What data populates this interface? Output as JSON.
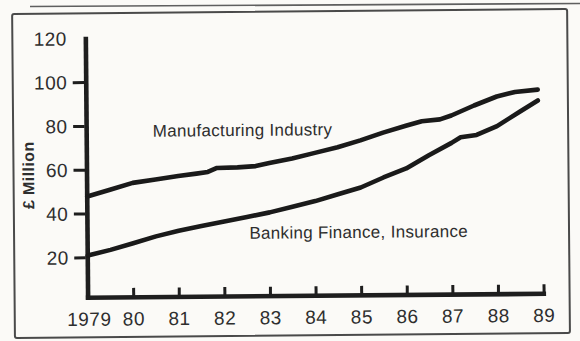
{
  "figure": {
    "background_color": "#fbfaf7",
    "ink_color": "#2e2e2e",
    "curve_color": "#1a1a1a",
    "frame_color": "#4a4a4a"
  },
  "chart_data": {
    "type": "line",
    "title": "",
    "xlabel": "",
    "ylabel": "£ Million",
    "xlim": [
      1979,
      1989
    ],
    "ylim": [
      20,
      120
    ],
    "grid": false,
    "legend_position": "inline-annotations",
    "y_tick_values": [
      120,
      100,
      80,
      60,
      40,
      20
    ],
    "y_tick_labels": [
      "120",
      "100",
      "80",
      "60",
      "40",
      "20"
    ],
    "x_tick_years": [
      1979,
      1980,
      1981,
      1982,
      1983,
      1984,
      1985,
      1986,
      1987,
      1988,
      1989
    ],
    "x_tick_labels": [
      "1979",
      "80",
      "81",
      "82",
      "83",
      "84",
      "85",
      "86",
      "87",
      "88",
      "89"
    ],
    "series": [
      {
        "name": "Manufacturing Industry",
        "color": "#1a1a1a",
        "points": [
          [
            1979,
            48
          ],
          [
            1979.5,
            51
          ],
          [
            1980,
            54
          ],
          [
            1980.5,
            55.5
          ],
          [
            1981,
            57
          ],
          [
            1981.4,
            58
          ],
          [
            1981.65,
            58.7
          ],
          [
            1981.85,
            60.5
          ],
          [
            1982.3,
            60.7
          ],
          [
            1982.7,
            61.2
          ],
          [
            1983,
            62.5
          ],
          [
            1983.5,
            64.5
          ],
          [
            1984,
            67
          ],
          [
            1984.5,
            69.5
          ],
          [
            1985,
            72.5
          ],
          [
            1985.5,
            76
          ],
          [
            1986,
            79
          ],
          [
            1986.35,
            81
          ],
          [
            1986.75,
            81.8
          ],
          [
            1987,
            83.5
          ],
          [
            1987.5,
            88
          ],
          [
            1988,
            92
          ],
          [
            1988.4,
            94
          ],
          [
            1988.9,
            95
          ]
        ]
      },
      {
        "name": "Banking Finance, Insurance",
        "color": "#1a1a1a",
        "points": [
          [
            1979,
            21
          ],
          [
            1979.5,
            23.5
          ],
          [
            1980,
            26.5
          ],
          [
            1980.5,
            29.5
          ],
          [
            1981,
            32
          ],
          [
            1981.5,
            34
          ],
          [
            1982,
            36
          ],
          [
            1982.5,
            38
          ],
          [
            1983,
            40
          ],
          [
            1983.5,
            42.5
          ],
          [
            1984,
            45
          ],
          [
            1984.5,
            48
          ],
          [
            1985,
            51
          ],
          [
            1985.5,
            55.5
          ],
          [
            1986,
            59.5
          ],
          [
            1986.5,
            65.5
          ],
          [
            1987,
            71
          ],
          [
            1987.2,
            73.5
          ],
          [
            1987.55,
            74.5
          ],
          [
            1988,
            78.5
          ],
          [
            1988.5,
            85
          ],
          [
            1988.9,
            90
          ]
        ]
      }
    ],
    "annotations": [
      {
        "text": "Manufacturing Industry",
        "x_year": 1980.45,
        "y_value": 75
      },
      {
        "text": "Banking Finance, Insurance",
        "x_year": 1982.55,
        "y_value": 28
      }
    ]
  }
}
